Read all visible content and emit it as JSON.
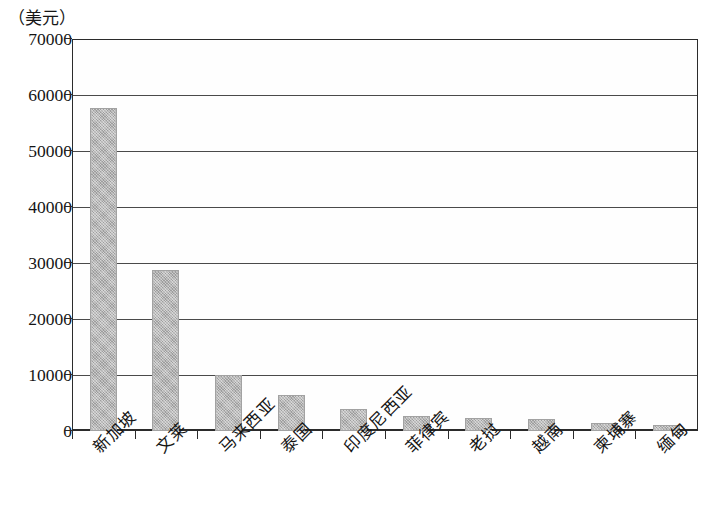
{
  "chart_data": {
    "type": "bar",
    "title": "",
    "subtitle": "",
    "unit_label": "（美元）",
    "xlabel": "",
    "ylabel": "",
    "ylim": [
      0,
      70000
    ],
    "ytick_values": [
      70000,
      60000,
      50000,
      40000,
      30000,
      20000,
      10000,
      0
    ],
    "ytick_labels": [
      "70000",
      "60000",
      "50000",
      "40000",
      "30000",
      "20000",
      "10000",
      "0"
    ],
    "grid": true,
    "legend": null,
    "legend_position": "none",
    "bar_color": "#b0b0b0",
    "axis_color": "#2b2b2b",
    "categories": [
      "新加坡",
      "文莱",
      "马来西亚",
      "泰国",
      "印度尼西亚",
      "菲律宾",
      "老挝",
      "越南",
      "柬埔寨",
      "缅甸"
    ],
    "values": [
      57700,
      28800,
      10000,
      6400,
      3900,
      2600,
      2300,
      2200,
      1400,
      1100
    ]
  }
}
